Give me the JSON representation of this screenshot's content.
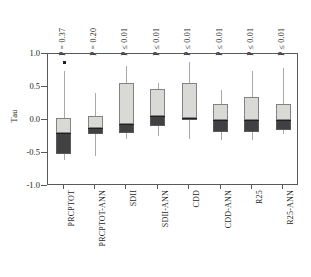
{
  "chart_data": {
    "type": "box",
    "title": "",
    "xlabel": "",
    "ylabel": "Tau",
    "ylim": [
      -1.0,
      1.0
    ],
    "ytick_labels": [
      "1.0",
      "0.5",
      "0.0",
      "-0.5",
      "-1.0"
    ],
    "ytick_values": [
      1.0,
      0.5,
      0.0,
      -0.5,
      -1.0
    ],
    "grid": false,
    "legend": "none",
    "categories": [
      "PRCPTOT",
      "PRCPTOT-ANN",
      "SDII",
      "SDII-ANN",
      "CDD",
      "CDD-ANN",
      "R25",
      "R25-ANN"
    ],
    "annotations": [
      "P = 0.37",
      "P = 0.20",
      "P ≤ 0.01",
      "P ≤ 0.01",
      "P ≤ 0.01",
      "P ≤ 0.01",
      "P ≤ 0.01",
      "P ≤ 0.01"
    ],
    "boxes": [
      {
        "category": "PRCPTOT",
        "whisker_low": -0.62,
        "q1": -0.53,
        "median": -0.21,
        "q3": 0.01,
        "whisker_high": 0.72,
        "outliers": [
          0.87
        ]
      },
      {
        "category": "PRCPTOT-ANN",
        "whisker_low": -0.56,
        "q1": -0.22,
        "median": -0.13,
        "q3": 0.04,
        "whisker_high": 0.39,
        "outliers": []
      },
      {
        "category": "SDII",
        "whisker_low": -0.3,
        "q1": -0.21,
        "median": -0.08,
        "q3": 0.55,
        "whisker_high": 0.8,
        "outliers": []
      },
      {
        "category": "SDII-ANN",
        "whisker_low": -0.26,
        "q1": -0.11,
        "median": 0.05,
        "q3": 0.46,
        "whisker_high": 0.55,
        "outliers": []
      },
      {
        "category": "CDD",
        "whisker_low": -0.31,
        "q1": -0.01,
        "median": 0.01,
        "q3": 0.55,
        "whisker_high": 0.87,
        "outliers": []
      },
      {
        "category": "CDD-ANN",
        "whisker_low": -0.32,
        "q1": -0.2,
        "median": -0.01,
        "q3": 0.23,
        "whisker_high": 0.44,
        "outliers": []
      },
      {
        "category": "R25",
        "whisker_low": -0.32,
        "q1": -0.2,
        "median": -0.01,
        "q3": 0.33,
        "whisker_high": 0.72,
        "outliers": []
      },
      {
        "category": "R25-ANN",
        "whisker_low": -0.23,
        "q1": -0.17,
        "median": -0.02,
        "q3": 0.22,
        "whisker_high": 0.78,
        "outliers": []
      }
    ],
    "colors": {
      "box_upper": "#d9d9d6",
      "box_lower": "#414042",
      "median": "#231f20",
      "whisker": "#a7a9ac",
      "axis": "#58595b",
      "text": "#231f20",
      "background": "#ffffff"
    }
  }
}
